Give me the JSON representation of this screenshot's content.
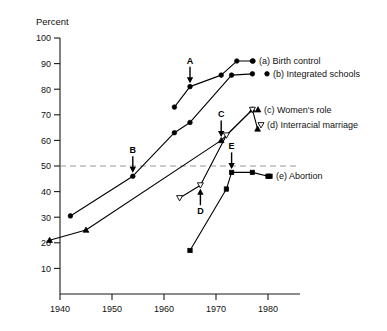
{
  "chart_data": {
    "type": "line",
    "title": "",
    "xlabel": "",
    "ylabel": "Percent",
    "xlim": [
      1936,
      1983
    ],
    "ylim": [
      0,
      100
    ],
    "xticks": [
      1940,
      1950,
      1960,
      1970,
      1980
    ],
    "xtick_labels": [
      "1940",
      "1950",
      "1960",
      "1970",
      "1980"
    ],
    "yticks": [
      10,
      20,
      30,
      40,
      50,
      60,
      70,
      80,
      90,
      100
    ],
    "ytick_labels": [
      "10",
      "20",
      "30",
      "40",
      "50",
      "60",
      "70",
      "80",
      "90",
      "100"
    ],
    "grid": false,
    "legend_position": "right-inline",
    "reference_lines": [
      {
        "name": "fifty-percent-line",
        "axis": "y",
        "value": 50,
        "style": "dashed",
        "color": "#9a9a9a"
      }
    ],
    "series": [
      {
        "key": "a",
        "name": "(a) Birth control",
        "marker": "filled-circle",
        "x": [
          1962,
          1965,
          1971,
          1974,
          1977
        ],
        "values": [
          73,
          81,
          85.5,
          91,
          91
        ]
      },
      {
        "key": "b",
        "name": "(b) Integrated schools",
        "marker": "filled-circle",
        "x": [
          1942,
          1954,
          1962,
          1965,
          1973,
          1977
        ],
        "values": [
          30.5,
          46,
          63,
          67,
          85.5,
          86
        ]
      },
      {
        "key": "c",
        "name": "(c) Women's role",
        "marker": "filled-triangle-up",
        "x": [
          1938,
          1945,
          1971,
          1977,
          1978
        ],
        "values": [
          21,
          25,
          60,
          72,
          64.5
        ]
      },
      {
        "key": "d",
        "name": "(d) Interracial marriage",
        "marker": "open-triangle-down",
        "x": [
          1963,
          1967,
          1972,
          1977
        ],
        "values": [
          37.5,
          42.5,
          62,
          72
        ]
      },
      {
        "key": "e",
        "name": "(e) Abortion",
        "marker": "filled-square",
        "x": [
          1965,
          1972,
          1973,
          1977,
          1980
        ],
        "values": [
          17,
          41,
          47.5,
          47.5,
          46
        ]
      }
    ],
    "annotations": [
      {
        "label": "A",
        "x": 1965,
        "y": 81,
        "series": "a",
        "arrow": "down"
      },
      {
        "label": "B",
        "x": 1954,
        "y": 46,
        "series": "b",
        "arrow": "down"
      },
      {
        "label": "C",
        "x": 1971,
        "y": 60,
        "series": "c",
        "arrow": "down"
      },
      {
        "label": "D",
        "x": 1967,
        "y": 42.5,
        "series": "d",
        "arrow": "up"
      },
      {
        "label": "E",
        "x": 1973,
        "y": 47.5,
        "series": "e",
        "arrow": "down"
      }
    ],
    "legend_entries": [
      {
        "key": "a",
        "label": "(a) Birth control",
        "marker": "filled-circle"
      },
      {
        "key": "b",
        "label": "(b) Integrated schools",
        "marker": "filled-circle"
      },
      {
        "key": "c",
        "label": "(c) Women's role",
        "marker": "filled-triangle-up"
      },
      {
        "key": "d",
        "label": "(d) Interracial marriage",
        "marker": "open-triangle-down"
      },
      {
        "key": "e",
        "label": "(e) Abortion",
        "marker": "filled-square"
      }
    ],
    "colors": {
      "ink": "#000000",
      "axis": "#1a1a1a",
      "reference": "#9a9a9a",
      "background": "#ffffff"
    }
  }
}
